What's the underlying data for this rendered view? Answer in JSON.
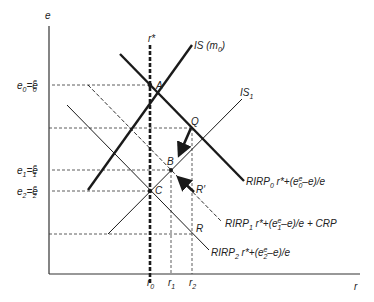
{
  "diagram": {
    "axes": {
      "y_label": "e",
      "x_label": "r"
    },
    "vertical_line_label": "r*",
    "y_ticks": [
      {
        "main": "e",
        "sub": "0",
        "eq": "=e",
        "sup": "e",
        "sub2": "0"
      },
      {
        "main": "e",
        "sub": "1",
        "eq": "=e",
        "sup": "e",
        "sub2": "1"
      },
      {
        "main": "e",
        "sub": "2",
        "eq": "=e",
        "sup": "e",
        "sub2": "2"
      }
    ],
    "x_ticks": [
      {
        "main": "r",
        "sub": "0"
      },
      {
        "main": "r",
        "sub": "1"
      },
      {
        "main": "r",
        "sub": "2"
      }
    ],
    "points": {
      "A": "A",
      "B": "B",
      "C": "C",
      "Q": "Q",
      "R": "R",
      "R_prime": "R′"
    },
    "curves": {
      "is0": {
        "main": "IS (m",
        "sub": "0",
        "tail": ")"
      },
      "is1": {
        "main": "IS",
        "sub": "1"
      },
      "rirp0": {
        "main": "RIRP",
        "sub": "0",
        "formula_a": " r*+(e",
        "sup": "e",
        "sub2": "0",
        "formula_b": "–e)/e"
      },
      "rirp1": {
        "main": "RIRP",
        "sub": "1",
        "formula_a": " r*+(e",
        "sup": "e",
        "sub2": "1",
        "formula_b": "–e)/e + CRP"
      },
      "rirp2": {
        "main": "RIRP",
        "sub": "2",
        "formula_a": " r*+(e",
        "sup": "e",
        "sub2": "2",
        "formula_b": "–e)/e"
      }
    },
    "colors": {
      "line": "#1a1a1a",
      "background": "#ffffff"
    }
  }
}
